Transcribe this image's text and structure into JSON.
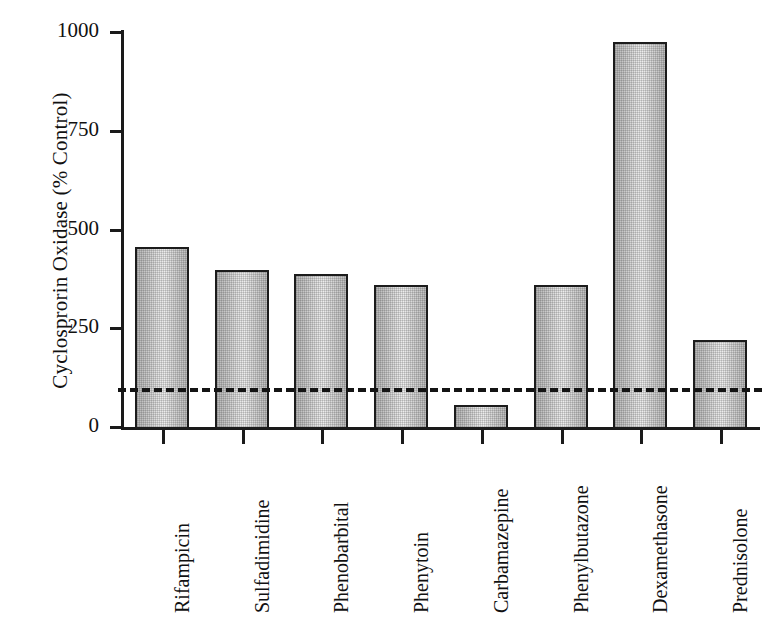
{
  "chart_data": {
    "type": "bar",
    "title": "",
    "xlabel": "",
    "ylabel": "Cyclosprorin Oxidase (% Control)",
    "categories": [
      "Rifampicin",
      "Sulfadimidine",
      "Phenobarbital",
      "Phenytoin",
      "Carbamazepine",
      "Phenylbutazone",
      "Dexamethasone",
      "Prednisolone"
    ],
    "values": [
      455,
      398,
      388,
      360,
      55,
      360,
      975,
      220
    ],
    "ylim": [
      0,
      1000
    ],
    "yticks": [
      0,
      250,
      500,
      750,
      1000
    ],
    "ytick_labels": [
      "0",
      "250",
      "500",
      "750",
      "1000"
    ],
    "grid": false,
    "legend": "none",
    "annotations": [
      {
        "type": "hline",
        "name": "control-reference-line",
        "value": 100,
        "style": "dashed",
        "label": "100% control"
      }
    ],
    "bar_style": {
      "fill": "#d8d8d8",
      "edge": "#1c1c1c",
      "pattern": "cross-hatch-dither"
    }
  }
}
